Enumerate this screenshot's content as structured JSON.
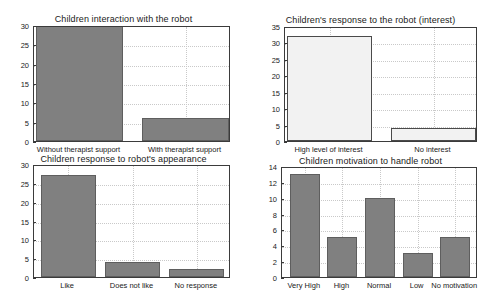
{
  "figure": {
    "background": "#ffffff",
    "panel_count": 4
  },
  "chart_data": [
    {
      "id": "children-interaction-with-the-robot",
      "type": "bar",
      "title": "Children interaction with the robot",
      "categories": [
        "Without therapist support",
        "With therapist support"
      ],
      "values": [
        30,
        6
      ],
      "xlabel": "",
      "ylabel": "",
      "ylim": [
        0,
        30
      ],
      "yticks": [
        0,
        5,
        10,
        15,
        20,
        25,
        30
      ],
      "grid": true,
      "bar_style": "solid-gray",
      "bar_color": "#808080",
      "legend": "none"
    },
    {
      "id": "childrens-response-to-the-robot-interest",
      "type": "bar",
      "title": "Children's response to the robot (interest)",
      "categories": [
        "High level of interest",
        "No interest"
      ],
      "values": [
        32,
        4
      ],
      "xlabel": "",
      "ylabel": "",
      "ylim": [
        0,
        35
      ],
      "yticks": [
        0,
        5,
        10,
        15,
        20,
        25,
        30,
        35
      ],
      "grid": true,
      "bar_style": "light-outlined",
      "bar_color": "#f2f2f2",
      "legend": "none"
    },
    {
      "id": "children-response-to-robots-appearance",
      "type": "bar",
      "title": "Children response to robot's appearance",
      "categories": [
        "Like",
        "Does not like",
        "No response"
      ],
      "values": [
        27,
        4,
        2
      ],
      "xlabel": "",
      "ylabel": "",
      "ylim": [
        0,
        30
      ],
      "yticks": [
        0,
        5,
        10,
        15,
        20,
        25,
        30
      ],
      "grid": true,
      "bar_style": "solid-gray",
      "bar_color": "#808080",
      "legend": "none"
    },
    {
      "id": "children-motivation-to-handle-robot",
      "type": "bar",
      "title": "Children motivation to handle robot",
      "categories": [
        "Very High",
        "High",
        "Normal",
        "Low",
        "No motivation"
      ],
      "values": [
        13,
        5,
        10,
        3,
        5
      ],
      "xlabel": "",
      "ylabel": "",
      "ylim": [
        0,
        14
      ],
      "yticks": [
        0,
        2,
        4,
        6,
        8,
        10,
        12,
        14
      ],
      "grid": true,
      "bar_style": "solid-gray",
      "bar_color": "#808080",
      "legend": "none"
    }
  ]
}
